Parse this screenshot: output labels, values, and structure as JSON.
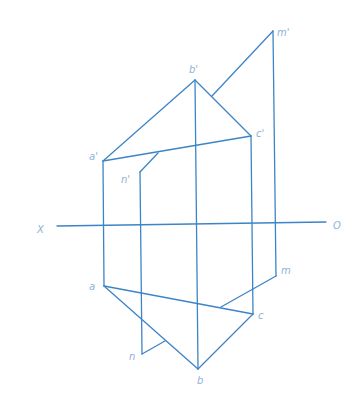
{
  "diagram": {
    "type": "orthographic projection",
    "colors": {
      "line": "#3d84c6",
      "label": "#8fb3d6",
      "background": "#ffffff"
    },
    "axis": {
      "left_label": "X",
      "right_label": "O"
    },
    "front_view": {
      "labels": {
        "a": "a'",
        "b": "b'",
        "c": "c'",
        "m": "m'",
        "n": "n'"
      }
    },
    "top_view": {
      "labels": {
        "a": "a",
        "b": "b",
        "c": "c",
        "m": "m",
        "n": "n"
      }
    }
  }
}
